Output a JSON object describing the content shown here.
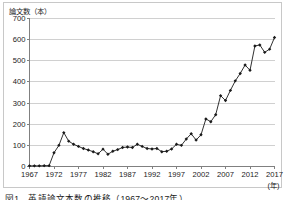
{
  "chart_data": {
    "type": "line",
    "title": "",
    "caption": "図1　英語論文本数の推移（1967～2017年）",
    "ylabel": "論文数（本）",
    "xlabel": "(年)",
    "ylim": [
      0,
      700
    ],
    "xlim": [
      1967,
      2017
    ],
    "ytick_values": [
      0,
      100,
      200,
      300,
      400,
      500,
      600,
      700
    ],
    "ytick_labels": [
      "0",
      "100",
      "200",
      "300",
      "400",
      "500",
      "600",
      "700"
    ],
    "xtick_values": [
      1967,
      1972,
      1977,
      1982,
      1987,
      1992,
      1997,
      2002,
      2007,
      2012,
      2017
    ],
    "xtick_labels": [
      "1967",
      "1972",
      "1977",
      "1982",
      "1987",
      "1992",
      "1997",
      "2002",
      "2007",
      "2012",
      "2017"
    ],
    "grid": "horizontal",
    "legend": "none",
    "marker": "diamond",
    "line_color": "#1a1a1a",
    "marker_color": "#1a1a1a",
    "grid_color": "#d0d0d0",
    "axis_color": "#808080",
    "x": [
      1967,
      1968,
      1969,
      1970,
      1971,
      1972,
      1973,
      1974,
      1975,
      1976,
      1977,
      1978,
      1979,
      1980,
      1981,
      1982,
      1983,
      1984,
      1985,
      1986,
      1987,
      1988,
      1989,
      1990,
      1991,
      1992,
      1993,
      1994,
      1995,
      1996,
      1997,
      1998,
      1999,
      2000,
      2001,
      2002,
      2003,
      2004,
      2005,
      2006,
      2007,
      2008,
      2009,
      2010,
      2011,
      2012,
      2013,
      2014,
      2015,
      2016,
      2017
    ],
    "values": [
      3,
      3,
      3,
      4,
      4,
      65,
      100,
      160,
      120,
      105,
      95,
      85,
      78,
      70,
      60,
      82,
      58,
      72,
      80,
      90,
      92,
      90,
      105,
      95,
      85,
      83,
      85,
      70,
      72,
      83,
      105,
      100,
      130,
      155,
      125,
      150,
      225,
      212,
      245,
      335,
      312,
      360,
      405,
      440,
      480,
      455,
      570,
      575,
      540,
      555,
      610
    ],
    "series_name": "論文数"
  },
  "axis_labels": {
    "y_title": "論文数（本）",
    "x_unit": "(年)"
  },
  "caption": {
    "text": "図1　英語論文本数の推移（1967～2017年）"
  }
}
